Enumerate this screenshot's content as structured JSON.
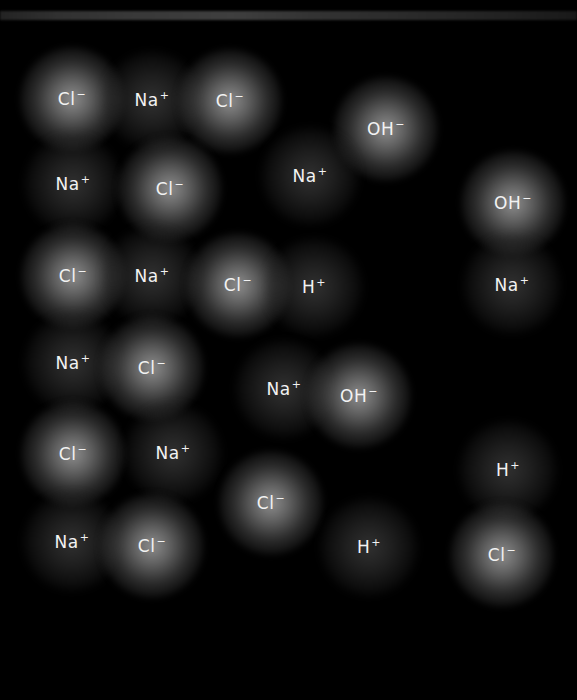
{
  "scene": {
    "description": "Ions in aqueous solution (dark field with glowing ions)",
    "background_color": "#000000",
    "label_color": "#f2f2f2"
  },
  "ions": [
    {
      "symbol": "Cl",
      "charge": "−",
      "x": 72,
      "y": 99,
      "glow": "strong"
    },
    {
      "symbol": "Na",
      "charge": "+",
      "x": 152,
      "y": 100,
      "glow": "weak"
    },
    {
      "symbol": "Cl",
      "charge": "−",
      "x": 230,
      "y": 101,
      "glow": "strong"
    },
    {
      "symbol": "OH",
      "charge": "−",
      "x": 386,
      "y": 129,
      "glow": "strong"
    },
    {
      "symbol": "Na",
      "charge": "+",
      "x": 73,
      "y": 184,
      "glow": "weak"
    },
    {
      "symbol": "Cl",
      "charge": "−",
      "x": 170,
      "y": 189,
      "glow": "strong"
    },
    {
      "symbol": "Na",
      "charge": "+",
      "x": 310,
      "y": 176,
      "glow": "weak"
    },
    {
      "symbol": "OH",
      "charge": "−",
      "x": 513,
      "y": 203,
      "glow": "strong"
    },
    {
      "symbol": "Cl",
      "charge": "−",
      "x": 73,
      "y": 276,
      "glow": "strong"
    },
    {
      "symbol": "Na",
      "charge": "+",
      "x": 152,
      "y": 276,
      "glow": "weak"
    },
    {
      "symbol": "Cl",
      "charge": "−",
      "x": 238,
      "y": 285,
      "glow": "strong"
    },
    {
      "symbol": "H",
      "charge": "+",
      "x": 314,
      "y": 287,
      "glow": "weak"
    },
    {
      "symbol": "Na",
      "charge": "+",
      "x": 512,
      "y": 285,
      "glow": "weak"
    },
    {
      "symbol": "Na",
      "charge": "+",
      "x": 73,
      "y": 363,
      "glow": "weak"
    },
    {
      "symbol": "Cl",
      "charge": "−",
      "x": 152,
      "y": 368,
      "glow": "strong"
    },
    {
      "symbol": "Na",
      "charge": "+",
      "x": 284,
      "y": 389,
      "glow": "weak"
    },
    {
      "symbol": "OH",
      "charge": "−",
      "x": 359,
      "y": 396,
      "glow": "strong"
    },
    {
      "symbol": "Cl",
      "charge": "−",
      "x": 73,
      "y": 454,
      "glow": "strong"
    },
    {
      "symbol": "Na",
      "charge": "+",
      "x": 173,
      "y": 453,
      "glow": "weak"
    },
    {
      "symbol": "Cl",
      "charge": "−",
      "x": 271,
      "y": 503,
      "glow": "strong"
    },
    {
      "symbol": "H",
      "charge": "+",
      "x": 508,
      "y": 470,
      "glow": "weak"
    },
    {
      "symbol": "Na",
      "charge": "+",
      "x": 72,
      "y": 542,
      "glow": "weak"
    },
    {
      "symbol": "Cl",
      "charge": "−",
      "x": 152,
      "y": 546,
      "glow": "strong"
    },
    {
      "symbol": "H",
      "charge": "+",
      "x": 369,
      "y": 547,
      "glow": "weak"
    },
    {
      "symbol": "Cl",
      "charge": "−",
      "x": 502,
      "y": 555,
      "glow": "strong"
    }
  ]
}
